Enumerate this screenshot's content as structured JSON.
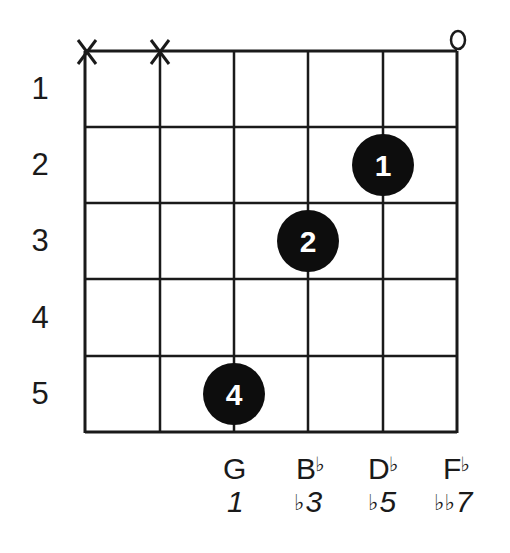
{
  "chord": {
    "root": "G",
    "notes": [
      "G",
      "B♭",
      "D♭",
      "F♭"
    ],
    "intervals": [
      "1",
      "♭3",
      "♭5",
      "♭♭7"
    ]
  },
  "diagram": {
    "strings": 6,
    "frets_shown": 5,
    "fret_numbers": [
      "1",
      "2",
      "3",
      "4",
      "5"
    ],
    "string_markers": [
      {
        "string": 1,
        "marker": "X",
        "meaning": "muted"
      },
      {
        "string": 2,
        "marker": "X",
        "meaning": "muted"
      },
      {
        "string": 6,
        "marker": "o",
        "meaning": "open"
      }
    ],
    "finger_dots": [
      {
        "string": 5,
        "fret": 2,
        "finger": "1"
      },
      {
        "string": 4,
        "fret": 3,
        "finger": "2"
      },
      {
        "string": 3,
        "fret": 5,
        "finger": "4"
      }
    ],
    "note_labels": [
      {
        "string": 3,
        "note": "G",
        "note_base": "G",
        "note_accidental": "",
        "interval": "1",
        "interval_accidental": "",
        "interval_base": "1"
      },
      {
        "string": 4,
        "note": "B♭",
        "note_base": "B",
        "note_accidental": "♭",
        "interval": "♭3",
        "interval_accidental": "♭",
        "interval_base": "3"
      },
      {
        "string": 5,
        "note": "D♭",
        "note_base": "D",
        "note_accidental": "♭",
        "interval": "♭5",
        "interval_accidental": "♭",
        "interval_base": "5"
      },
      {
        "string": 6,
        "note": "F♭",
        "note_base": "F",
        "note_accidental": "♭",
        "interval": "♭♭7",
        "interval_accidental": "♭♭",
        "interval_base": "7"
      }
    ]
  },
  "colors": {
    "line": "#1a1a1a",
    "dot_fill": "#0d0d0d",
    "dot_text": "#ffffff",
    "background": "#ffffff"
  }
}
